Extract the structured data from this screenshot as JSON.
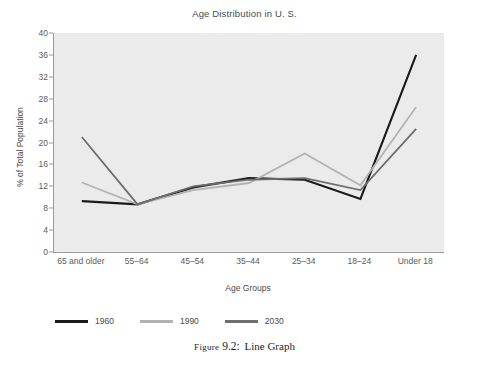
{
  "chart_data": {
    "type": "line",
    "title": "Age Distribution in U. S.",
    "xlabel": "Age Groups",
    "ylabel": "% of Total Population",
    "categories": [
      "65 and older",
      "55–64",
      "45–54",
      "35–44",
      "25–34",
      "18–24",
      "Under 18"
    ],
    "yticks": [
      0,
      4,
      8,
      12,
      16,
      20,
      24,
      28,
      32,
      36,
      40
    ],
    "ylim": [
      0,
      40
    ],
    "grid": false,
    "legend_position": "below-plot-left",
    "series": [
      {
        "name": "1960",
        "color": "#1a1a1a",
        "values": [
          9.3,
          8.7,
          11.8,
          13.5,
          13.2,
          9.7,
          36.0
        ]
      },
      {
        "name": "1990",
        "color": "#b3b3b3",
        "values": [
          12.7,
          8.7,
          11.3,
          12.6,
          18.0,
          12.2,
          26.5
        ]
      },
      {
        "name": "2030",
        "color": "#6e6e6e",
        "values": [
          21.0,
          8.7,
          12.0,
          13.2,
          13.5,
          11.3,
          22.5
        ]
      }
    ]
  },
  "caption": {
    "figure_word": "Figure",
    "figure_number": "9.2:",
    "figure_text": "Line Graph"
  }
}
